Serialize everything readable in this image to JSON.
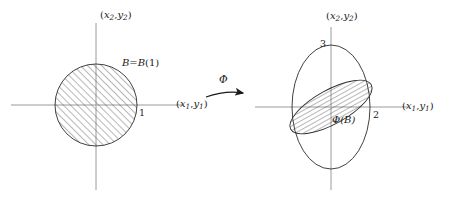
{
  "figure": {
    "type": "math-diagram",
    "background_color": "#ffffff",
    "stroke_color": "#2b2b2b",
    "axis_color": "#9a9a9a",
    "hatch_color": "#4a4a4a"
  },
  "left_panel": {
    "name": "source-plane",
    "vertical_axis_label": {
      "open": "(",
      "var1": "x",
      "sub1": "2",
      "comma": ",",
      "var2": "y",
      "sub2": "2",
      "close": ")",
      "text": "(x2,y2)"
    },
    "horizontal_axis_label": {
      "open": "(",
      "var1": "x",
      "sub1": "1",
      "comma": ",",
      "var2": "y",
      "sub2": "1",
      "close": ")",
      "text": "(x1,y1)"
    },
    "region_label": "B=B(1)",
    "region_label_parts": {
      "b": "B",
      "eq": "=",
      "bb": "B",
      "arg": "(1)"
    },
    "tick_label": "1",
    "shape": {
      "kind": "circle",
      "cx": 96,
      "cy": 105,
      "r": 41,
      "hatched": true,
      "hatch_angle_deg": 45
    }
  },
  "arrow": {
    "name": "phi-map-arrow",
    "label": "Φ",
    "direction": "left-to-right"
  },
  "right_panel": {
    "name": "target-plane",
    "vertical_axis_label": {
      "open": "(",
      "var1": "x",
      "sub1": "2",
      "comma": ",",
      "var2": "y",
      "sub2": "2",
      "close": ")",
      "text": "(x2,y2)"
    },
    "horizontal_axis_label": {
      "open": "(",
      "var1": "x",
      "sub1": "1",
      "comma": ",",
      "var2": "y",
      "sub2": "1",
      "close": ")",
      "text": "(x1,y1)"
    },
    "image_label": "Φ(B)",
    "tick_label_vertical": "3",
    "tick_label_horizontal": "2",
    "outer_shape": {
      "kind": "ellipse",
      "cx": 331,
      "cy": 107,
      "rx": 39,
      "ry": 62,
      "hatched": false
    },
    "inner_shape": {
      "kind": "ellipse",
      "cx": 331,
      "cy": 107,
      "rx": 46,
      "ry": 17,
      "rotation_deg": -29,
      "hatched": true,
      "hatch_angle_deg": 0
    }
  }
}
